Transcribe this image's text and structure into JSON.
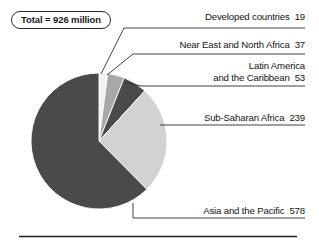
{
  "figure": {
    "total_badge": "Total = 926 million",
    "bottom_rule": "horizontal-rule"
  },
  "chart_data": {
    "type": "pie",
    "title": "",
    "subtitle": "",
    "unit": "million",
    "total": 926,
    "total_label": "Total = 926 million",
    "start_angle_deg": 0,
    "direction": "clockwise",
    "legend": "callout-labels",
    "labels": [
      "Developed countries",
      "Near East and North Africa",
      "Latin America and the Caribbean",
      "Sub-Saharan Africa",
      "Asia and the Pacific"
    ],
    "categories": [
      "Developed countries",
      "Near East and North Africa",
      "Latin America and the Caribbean",
      "Sub-Saharan Africa",
      "Asia and the Pacific"
    ],
    "values": [
      19,
      37,
      53,
      239,
      578
    ],
    "colors": [
      "#f2f2f2",
      "#a8a8a8",
      "#4a4a4a",
      "#d2d2d2",
      "#4a4a4a"
    ],
    "slices": [
      {
        "label": "Developed countries",
        "value": 19,
        "value_text": "19",
        "color": "#f2f2f2",
        "angle_deg": 7.4
      },
      {
        "label": "Near East and North Africa",
        "value": 37,
        "value_text": "37",
        "color": "#a8a8a8",
        "angle_deg": 14.4
      },
      {
        "label": "Latin America and the Caribbean",
        "value": 53,
        "value_text": "53",
        "color": "#4a4a4a",
        "angle_deg": 20.6
      },
      {
        "label": "Sub-Saharan Africa",
        "value": 239,
        "value_text": "239",
        "color": "#d2d2d2",
        "angle_deg": 92.9
      },
      {
        "label": "Asia and the Pacific",
        "value": 578,
        "value_text": "578",
        "color": "#4a4a4a",
        "angle_deg": 224.7
      }
    ]
  },
  "callouts": {
    "developed": {
      "text": "Developed countries",
      "value": "19"
    },
    "neareast": {
      "text": "Near East and North Africa",
      "value": "37"
    },
    "latin": {
      "line1": "Latin America",
      "line2": "and the Caribbean",
      "value": "53"
    },
    "subsaharan": {
      "text": "Sub-Saharan Africa",
      "value": "239"
    },
    "asia": {
      "text": "Asia and the Pacific",
      "value": "578"
    }
  }
}
